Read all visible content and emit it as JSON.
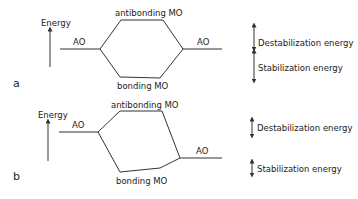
{
  "diagram": {
    "type": "molecular-orbital-energy-diagram",
    "colors": {
      "ink": "#333333",
      "background": "#ffffff"
    },
    "panels": [
      {
        "id": "a",
        "label": "a",
        "axis_label": "Energy",
        "left_orbital": "AO",
        "right_orbital": "AO",
        "upper_orbital": "antibonding MO",
        "lower_orbital": "bonding MO",
        "legend": {
          "upper": "Destabilization energy",
          "lower": "Stabilization energy"
        },
        "note": "AOs equal in energy; splitting symmetric"
      },
      {
        "id": "b",
        "label": "b",
        "axis_label": "Energy",
        "left_orbital": "AO",
        "right_orbital": "AO",
        "upper_orbital": "antibonding MO",
        "lower_orbital": "bonding MO",
        "legend": {
          "upper": "Destabilization energy",
          "lower": "Stabilization energy"
        },
        "note": "AOs differ in energy; splitting asymmetric"
      }
    ]
  }
}
